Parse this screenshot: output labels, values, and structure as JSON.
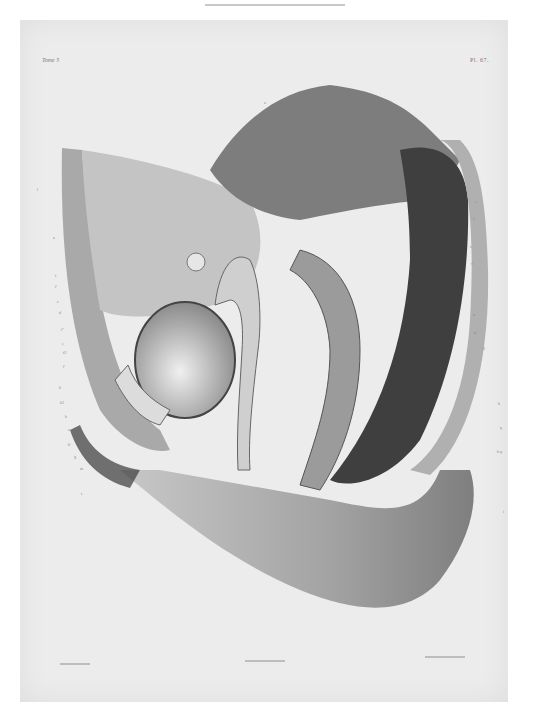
{
  "page": {
    "header_text": "",
    "background": "#ffffff"
  },
  "plate": {
    "volume_label": "Tome 5",
    "plate_number": "Pl. 67.",
    "background": "#ececec",
    "subject": "Sagittal section of the female pelvis (lithographic anatomical plate)",
    "credits": {
      "artist_left": "",
      "center": "",
      "printer_right": ""
    }
  },
  "labels": {
    "left": [
      {
        "text": "l",
        "x": 37,
        "y": 188
      },
      {
        "text": "a",
        "x": 53,
        "y": 236
      },
      {
        "text": "f",
        "x": 55,
        "y": 274
      },
      {
        "text": "f'",
        "x": 55,
        "y": 285
      },
      {
        "text": "c",
        "x": 57,
        "y": 300
      },
      {
        "text": "d",
        "x": 59,
        "y": 311
      },
      {
        "text": "f''",
        "x": 61,
        "y": 328
      },
      {
        "text": "e",
        "x": 62,
        "y": 342
      },
      {
        "text": "f2",
        "x": 63,
        "y": 351
      },
      {
        "text": "l'",
        "x": 63,
        "y": 365
      },
      {
        "text": "k",
        "x": 59,
        "y": 386
      },
      {
        "text": "k2",
        "x": 60,
        "y": 401
      },
      {
        "text": "h",
        "x": 65,
        "y": 415
      },
      {
        "text": "o",
        "x": 68,
        "y": 428
      },
      {
        "text": "h'",
        "x": 68,
        "y": 443
      },
      {
        "text": "g",
        "x": 74,
        "y": 455
      },
      {
        "text": "m",
        "x": 80,
        "y": 467
      },
      {
        "text": "t",
        "x": 81,
        "y": 492
      }
    ],
    "right": [
      {
        "text": "r",
        "x": 475,
        "y": 200
      },
      {
        "text": "s",
        "x": 473,
        "y": 217
      },
      {
        "text": "c",
        "x": 470,
        "y": 245
      },
      {
        "text": "v",
        "x": 471,
        "y": 262
      },
      {
        "text": "n",
        "x": 473,
        "y": 313
      },
      {
        "text": "q'",
        "x": 474,
        "y": 331
      },
      {
        "text": "f2",
        "x": 482,
        "y": 347
      },
      {
        "text": "k",
        "x": 498,
        "y": 402
      },
      {
        "text": "q",
        "x": 500,
        "y": 426
      },
      {
        "text": "h q",
        "x": 497,
        "y": 450
      },
      {
        "text": "i",
        "x": 503,
        "y": 510
      }
    ],
    "top": [
      {
        "text": "a",
        "x": 264,
        "y": 101
      },
      {
        "text": "a",
        "x": 330,
        "y": 95
      }
    ]
  }
}
